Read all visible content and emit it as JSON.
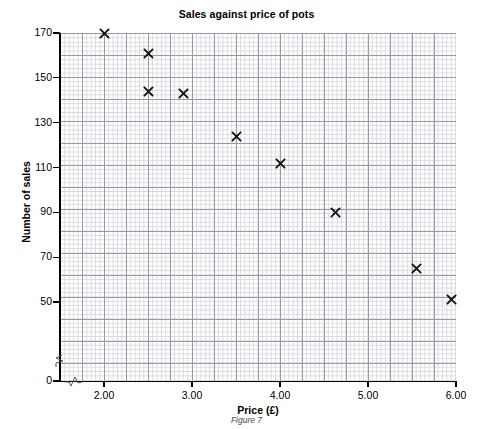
{
  "chart_data": {
    "type": "scatter",
    "title": "Sales against price of pots",
    "xlabel": "Price (£)",
    "ylabel": "Number of sales",
    "caption": "Figure 7",
    "grid": true,
    "grid_style": "graph-paper",
    "legend": null,
    "xlim": [
      1.55,
      6.05
    ],
    "ylim": [
      0,
      173
    ],
    "x_ticks": [
      2.0,
      3.0,
      4.0,
      5.0,
      6.0
    ],
    "x_tick_labels": [
      "2.00",
      "3.00",
      "4.00",
      "5.00",
      "6.00"
    ],
    "y_ticks": [
      0,
      50,
      70,
      90,
      110,
      130,
      150,
      170
    ],
    "y_tick_labels": [
      "0",
      "50",
      "70",
      "90",
      "110",
      "130",
      "150",
      "170"
    ],
    "axis_break_x": true,
    "axis_break_y": true,
    "marker": "x",
    "marker_color": "#111111",
    "x": [
      2.0,
      2.5,
      2.5,
      2.9,
      3.5,
      4.0,
      4.63,
      5.55,
      5.95
    ],
    "y": [
      170,
      161,
      144,
      143,
      124,
      112,
      90,
      65,
      51
    ],
    "points": [
      {
        "price": 2.0,
        "sales": 170
      },
      {
        "price": 2.5,
        "sales": 161
      },
      {
        "price": 2.5,
        "sales": 144
      },
      {
        "price": 2.9,
        "sales": 143
      },
      {
        "price": 3.5,
        "sales": 124
      },
      {
        "price": 4.0,
        "sales": 112
      },
      {
        "price": 4.63,
        "sales": 90
      },
      {
        "price": 5.55,
        "sales": 65
      },
      {
        "price": 5.95,
        "sales": 51
      }
    ]
  }
}
